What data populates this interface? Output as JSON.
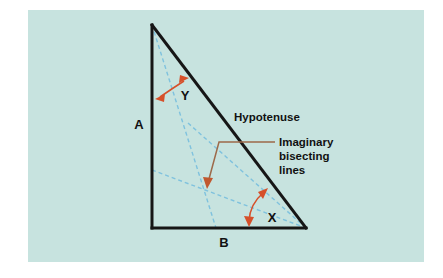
{
  "figure": {
    "canvas": {
      "width": 443,
      "height": 278
    },
    "panel": {
      "x": 28,
      "y": 10,
      "width": 396,
      "height": 252,
      "background_color": "#c7e3df",
      "outer_background_color": "#ffffff"
    }
  },
  "colors": {
    "panel_bg": "#c7e3df",
    "triangle_stroke": "#161616",
    "bisector_stroke": "#7fc2de",
    "arrow_red": "#d6502a",
    "leader_brown": "#9d6a4a",
    "text": "#111111"
  },
  "triangle": {
    "name": "right-triangle",
    "vertices": {
      "apex": {
        "x": 152,
        "y": 25
      },
      "bottom_left": {
        "x": 152,
        "y": 228
      },
      "bottom_right": {
        "x": 306,
        "y": 228
      }
    },
    "stroke_width": 3
  },
  "side_labels": [
    {
      "id": "side-a",
      "text": "A",
      "x": 139,
      "y": 129,
      "font_size": 13
    },
    {
      "id": "side-b",
      "text": "B",
      "x": 224,
      "y": 247,
      "font_size": 13
    }
  ],
  "angle_labels": [
    {
      "id": "angle-y",
      "text": "Y",
      "x": 185,
      "y": 100,
      "font_size": 13
    },
    {
      "id": "angle-x",
      "text": "X",
      "x": 272,
      "y": 222,
      "font_size": 13
    }
  ],
  "annotations": {
    "hypotenuse": {
      "text": "Hypotenuse",
      "x": 234,
      "y": 121,
      "font_size": 11.5
    },
    "imaginary_bisecting_lines": {
      "lines": [
        "Imaginary",
        "bisecting",
        "lines"
      ],
      "x": 279,
      "y": 150,
      "line_height": 14,
      "font_size": 11.5
    }
  },
  "bisectors": {
    "incenter": {
      "x": 207,
      "y": 190
    },
    "lines": [
      {
        "id": "bisector-from-apex",
        "from": {
          "x": 152,
          "y": 25
        },
        "to": {
          "x": 216,
          "y": 228
        },
        "dash": "4,3"
      },
      {
        "id": "bisector-from-bottom-left",
        "from": {
          "x": 152,
          "y": 170
        },
        "to": {
          "x": 306,
          "y": 228
        },
        "dash": "4,3"
      },
      {
        "id": "bisector-from-bottom-right",
        "from": {
          "x": 306,
          "y": 228
        },
        "to": {
          "x": 188,
          "y": 123
        },
        "dash": "4,3"
      }
    ],
    "stroke_width": 1.4
  },
  "angle_arcs": [
    {
      "id": "arc-angle-y",
      "path": "M 158 98 Q 172 88 185 80",
      "arrow_start": {
        "x": 158,
        "y": 98,
        "angle": 215
      },
      "arrow_end": {
        "x": 185,
        "y": 80,
        "angle": 325
      }
    },
    {
      "id": "arc-angle-x",
      "path": "M 249 224 Q 251 205 265 191",
      "arrow_start": {
        "x": 249,
        "y": 224,
        "angle": 105
      },
      "arrow_end": {
        "x": 265,
        "y": 191,
        "angle": 315
      }
    }
  ],
  "leader_line": {
    "id": "leader-imaginary-bisecting-lines",
    "points": "275,142 219,142 209,180",
    "arrow_tip": {
      "x": 207,
      "y": 188
    },
    "stroke_width": 1.5
  }
}
